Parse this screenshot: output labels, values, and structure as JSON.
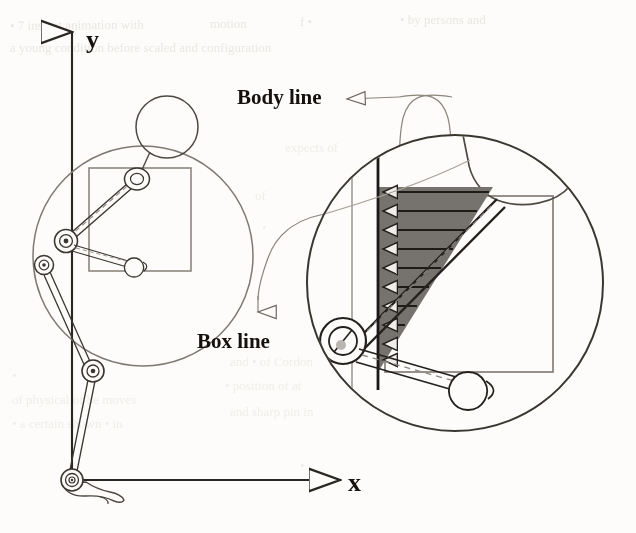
{
  "figure": {
    "background_color": "#fdfcfa",
    "ink_color": "#2a2622",
    "light_ink_color": "#8c857d",
    "shade_color": "#7d7a76",
    "labels": {
      "body_line": "Body line",
      "box_line": "Box line",
      "axis_y": "y",
      "axis_x": "x"
    },
    "annotations": [
      {
        "name": "body-line-callout",
        "text": "Body line",
        "arrow": "left",
        "target": "diagonal body line inside detail circle"
      },
      {
        "name": "box-line-callout",
        "text": "Box line",
        "arrow": "down",
        "target": "vertical box line inside detail circle"
      }
    ],
    "axes": {
      "origin_label": "ankle joint at origin",
      "y_label": "y",
      "x_label": "x",
      "y_arrow": "up",
      "x_arrow": "right"
    },
    "overview": {
      "name": "stick-figure-overview",
      "parts": [
        "head",
        "neck",
        "shoulder-joint",
        "torso-body-line",
        "hip-joint",
        "arm",
        "hand",
        "thigh",
        "knee-joint",
        "shank",
        "ankle-joint",
        "foot",
        "box"
      ],
      "magnifier_circle": {
        "cx": 143,
        "cy": 256,
        "r": 110
      }
    },
    "detail": {
      "name": "magnified-detail",
      "circle": {
        "cx": 455,
        "cy": 283,
        "r": 148
      },
      "shaded_region": {
        "shape": "triangle",
        "arrow_count": 10,
        "arrow_direction": "left",
        "fill": "#76736f"
      },
      "parts": [
        "head-arc",
        "neck",
        "body-line",
        "box-line",
        "hip-joint",
        "arm",
        "hand",
        "box-corner",
        "dashed-guides"
      ]
    },
    "ghost_text": [
      {
        "t": "motion",
        "x": 40,
        "y": 30
      },
      {
        "t": "scaled and configuration",
        "x": 150,
        "y": 52
      },
      {
        "t": "is seen",
        "x": 300,
        "y": 18
      },
      {
        "t": "expects of",
        "x": 420,
        "y": 148
      },
      {
        "t": "the",
        "x": 452,
        "y": 150
      },
      {
        "t": "position",
        "x": 250,
        "y": 370
      },
      {
        "t": "and sharp",
        "x": 400,
        "y": 386
      },
      {
        "t": "certain shown",
        "x": 260,
        "y": 418
      }
    ]
  }
}
